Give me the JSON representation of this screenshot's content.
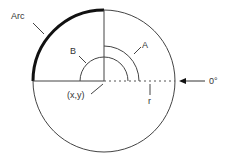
{
  "diagram": {
    "labels": {
      "arc": "Arc",
      "start_angle": "A",
      "end_angle": "B",
      "center": "(x,y)",
      "radius": "r",
      "zero_degrees": "0°"
    },
    "colors": {
      "stroke": "#444444",
      "arc_highlight": "#111111",
      "background": "#ffffff"
    },
    "geometry": {
      "center": [
        104,
        81
      ],
      "outer_radius": 71,
      "angle_a_radius": 35,
      "angle_b_radius": 24,
      "highlighted_arc_degrees": [
        90,
        180
      ]
    }
  }
}
